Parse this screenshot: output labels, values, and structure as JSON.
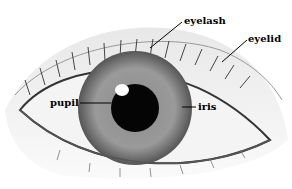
{
  "diagram": {
    "labels": {
      "eyelash": "eyelash",
      "eyelid": "eyelid",
      "pupil": "pupil",
      "iris": "iris"
    }
  }
}
